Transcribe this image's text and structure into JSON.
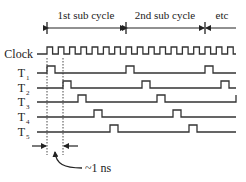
{
  "diagram": {
    "title_segments": [
      {
        "label": "1st sub cycle",
        "x_start": 47,
        "x_end": 126
      },
      {
        "label": "2nd sub cycle",
        "x_start": 126,
        "x_end": 205
      },
      {
        "label": "etc",
        "x_start": 205,
        "x_end": 236
      }
    ],
    "signals": [
      {
        "name": "Clock",
        "sub": "",
        "baseline_y": 54
      },
      {
        "name": "T",
        "sub": "1",
        "baseline_y": 73,
        "pulses": [
          47,
          126,
          205
        ]
      },
      {
        "name": "T",
        "sub": "2",
        "baseline_y": 88,
        "pulses": [
          63,
          142,
          221
        ]
      },
      {
        "name": "T",
        "sub": "3",
        "baseline_y": 102,
        "pulses": [
          78,
          157
        ]
      },
      {
        "name": "T",
        "sub": "4",
        "baseline_y": 117,
        "pulses": [
          94,
          173
        ]
      },
      {
        "name": "T",
        "sub": "5",
        "baseline_y": 132,
        "pulses": [
          110,
          189
        ]
      }
    ],
    "annotation": {
      "label": "~1 ns"
    },
    "line_color": "#333333"
  }
}
